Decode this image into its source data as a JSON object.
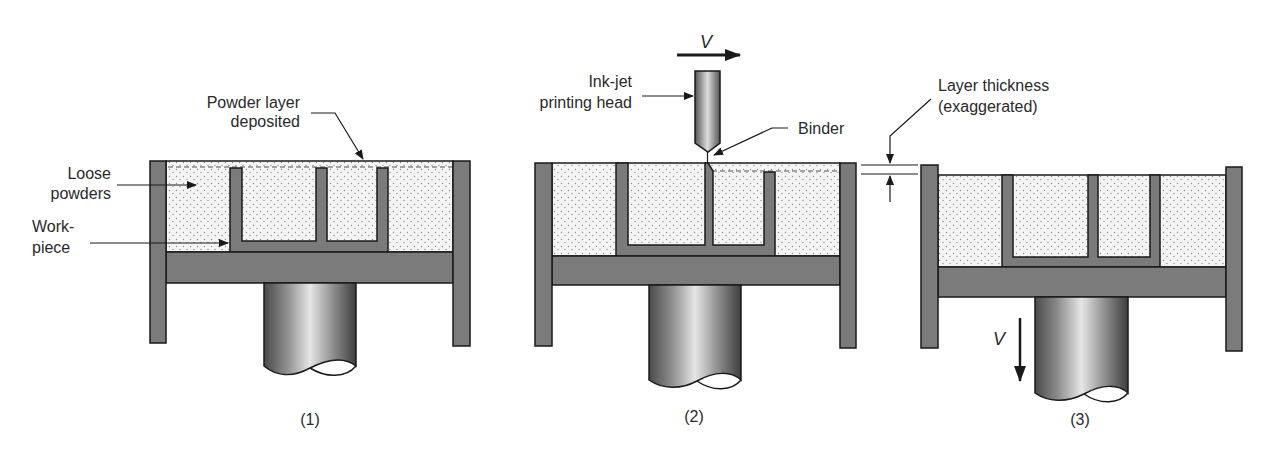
{
  "figure": {
    "colors": {
      "wall": "#7b7b7b",
      "outline": "#1a1a1a",
      "powder_fill": "#f4f4f4",
      "powder_dot": "#8a8a8a",
      "text": "#2a2a2a",
      "background": "#ffffff"
    },
    "labels": {
      "powder_layer_line1": "Powder layer",
      "powder_layer_line2": "deposited",
      "loose_powders_line1": "Loose",
      "loose_powders_line2": "powders",
      "workpiece_line1": "Work-",
      "workpiece_line2": "piece",
      "inkjet_line1": "Ink-jet",
      "inkjet_line2": "printing head",
      "binder": "Binder",
      "layer_thickness_line1": "Layer thickness",
      "layer_thickness_line2": "(exaggerated)",
      "velocity_horizontal": "V",
      "velocity_vertical": "V"
    },
    "steps": [
      {
        "id": 1,
        "caption": "(1)"
      },
      {
        "id": 2,
        "caption": "(2)"
      },
      {
        "id": 3,
        "caption": "(3)"
      }
    ]
  }
}
